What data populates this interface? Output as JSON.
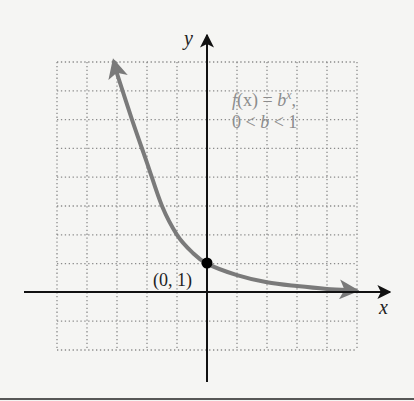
{
  "chart_data": {
    "type": "line",
    "title": "",
    "xlabel": "x",
    "ylabel": "y",
    "xlim": [
      -5,
      5
    ],
    "ylim": [
      -2,
      8
    ],
    "grid": true,
    "grid_style": "dotted",
    "legend": null,
    "series": [
      {
        "name": "f(x) = b^x, 0 < b < 1",
        "function": "b^x",
        "x": [
          -3.1,
          -3.0,
          -2.5,
          -2.0,
          -1.5,
          -1.0,
          -0.5,
          0.0,
          1.0,
          2.0,
          3.0,
          4.0,
          4.95
        ],
        "y": [
          8.0,
          7.6,
          6.0,
          4.5,
          3.0,
          2.0,
          1.4,
          1.0,
          0.6,
          0.35,
          0.22,
          0.12,
          0.07
        ],
        "color": "#7a7a7a",
        "arrows": "both"
      }
    ],
    "annotations": [
      {
        "text": "f(x) = b^x,",
        "line": 1,
        "position": "upper-right"
      },
      {
        "text": "0 < b < 1",
        "line": 2,
        "position": "upper-right"
      },
      {
        "text": "(0, 1)",
        "point": [
          0,
          1
        ],
        "marker": "filled-circle"
      }
    ]
  },
  "labels": {
    "x_axis": "x",
    "y_axis": "y",
    "function_line1_f": "f",
    "function_line1_rest": "(x) = ",
    "function_line1_b": "b",
    "function_line1_exp": "x",
    "function_line1_comma": ",",
    "function_line2_0": "0 < ",
    "function_line2_b": "b",
    "function_line2_rest": " < 1",
    "point_label": "(0, 1)"
  },
  "colors": {
    "background": "#f5f5f3",
    "axis": "#111111",
    "curve": "#7a7a7a",
    "grid": "#8a8a8a",
    "annotation_text": "#8c8c8c",
    "point": "#000000"
  }
}
